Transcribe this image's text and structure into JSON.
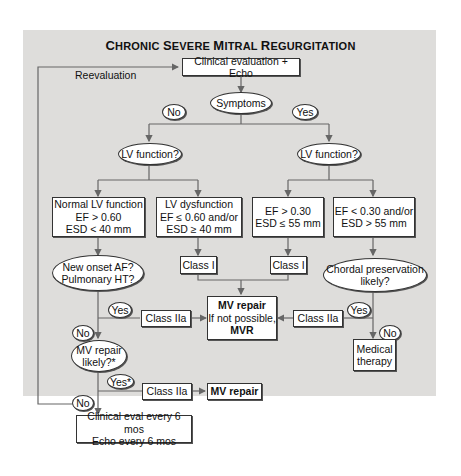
{
  "title": "Chronic Severe Mitral Regurgitation",
  "reevaluation_label": "Reevaluation",
  "nodes": {
    "clinical_eval": "Clinical evaluation + Echo",
    "symptoms": "Symptoms",
    "no_top": "No",
    "yes_top": "Yes",
    "lv_function_left": "LV function?",
    "lv_function_right": "LV function?",
    "normal_lv": [
      "Normal LV function",
      "EF > 0.60",
      "ESD < 40 mm"
    ],
    "lv_dysfunction": [
      "LV dysfunction",
      "EF ≤ 0.60 and/or",
      "ESD ≥ 40 mm"
    ],
    "ef_gt_030": [
      "EF > 0.30",
      "ESD ≤ 55 mm"
    ],
    "ef_lt_030": [
      "EF < 0.30 and/or",
      "ESD > 55 mm"
    ],
    "class_i_left": "Class I",
    "class_i_right": "Class I",
    "new_onset_af": [
      "New onset AF?",
      "Pulmonary HT?"
    ],
    "chordal": [
      "Chordal preservation",
      "likely?"
    ],
    "yes_af": "Yes",
    "no_af": "No",
    "class_iia_left": "Class IIa",
    "class_iia_right": "Class IIa",
    "mv_repair_center": [
      "MV repair",
      "If not possible,",
      "MVR"
    ],
    "yes_chordal": "Yes",
    "no_chordal": "No",
    "medical_therapy": [
      "Medical",
      "therapy"
    ],
    "mv_repair_likely": [
      "MV repair",
      "likely?*"
    ],
    "yes_star": "Yes*",
    "no_bottom": "No",
    "class_iia_bottom": "Class IIa",
    "mv_repair_bottom": "MV repair",
    "followup": [
      "Clinical eval every 6 mos",
      "Echo every 6 mos"
    ]
  }
}
